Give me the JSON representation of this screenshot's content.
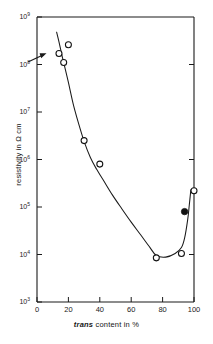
{
  "figure": {
    "background_color": "#ffffff",
    "line_color": "#1a1a1a"
  },
  "axes": {
    "x": {
      "title_prefix": "trans",
      "title_rest": " content  in  %",
      "ticks": [
        "0",
        "20",
        "40",
        "60",
        "80",
        "100"
      ],
      "tick_values": [
        0,
        20,
        40,
        60,
        80,
        100
      ],
      "range": [
        0,
        100
      ]
    },
    "y": {
      "title": "resistivity in   Ω cm",
      "ticks": [
        {
          "mantissa": "10",
          "exponent": "9"
        },
        {
          "mantissa": "10",
          "exponent": "8"
        },
        {
          "mantissa": "10",
          "exponent": "7"
        },
        {
          "mantissa": "10",
          "exponent": "6"
        },
        {
          "mantissa": "10",
          "exponent": "5"
        },
        {
          "mantissa": "10",
          "exponent": "4"
        },
        {
          "mantissa": "10",
          "exponent": "3"
        }
      ],
      "tick_values": [
        1000000000.0,
        100000000.0,
        10000000.0,
        1000000.0,
        100000.0,
        10000.0,
        1000.0
      ],
      "range": [
        1000,
        1000000000
      ]
    }
  },
  "annotations": {
    "arrow": {
      "name": "pointer-arrow",
      "target_x": 14,
      "target_y": 170000000
    }
  },
  "chart_data": {
    "type": "scatter",
    "title": "",
    "subtitle": "",
    "xlabel": "trans content in %",
    "ylabel": "resistivity in Ω cm",
    "xlim": [
      0,
      100
    ],
    "ylim": [
      1000,
      1000000000
    ],
    "yscale": "log",
    "xscale": "linear",
    "grid": false,
    "legend": false,
    "legend_position": "none",
    "series": [
      {
        "name": "open circles",
        "marker": "open-circle",
        "x": [
          14,
          17,
          20,
          30,
          40,
          76,
          92,
          100
        ],
        "y": [
          170000000,
          110000000,
          260000000,
          2500000,
          800000,
          8500,
          10500,
          220000
        ]
      },
      {
        "name": "filled circle",
        "marker": "filled-circle",
        "x": [
          94
        ],
        "y": [
          80000
        ]
      }
    ],
    "fit_curve": {
      "name": "trend-curve",
      "x": [
        12.5,
        14,
        16,
        18,
        20,
        23,
        26,
        30,
        34,
        38,
        42,
        48,
        54,
        60,
        66,
        72,
        76,
        82,
        88,
        92,
        94,
        96,
        97,
        98
      ],
      "y": [
        480000000,
        300000000,
        150000000,
        80000000,
        42000000,
        15000000,
        6500000,
        2400000,
        1100000,
        620000,
        380000,
        180000,
        92000,
        48000,
        26000,
        14000,
        9500,
        8800,
        10500,
        14000,
        22000,
        55000,
        110000,
        230000
      ]
    }
  },
  "caption": {
    "text": ""
  }
}
